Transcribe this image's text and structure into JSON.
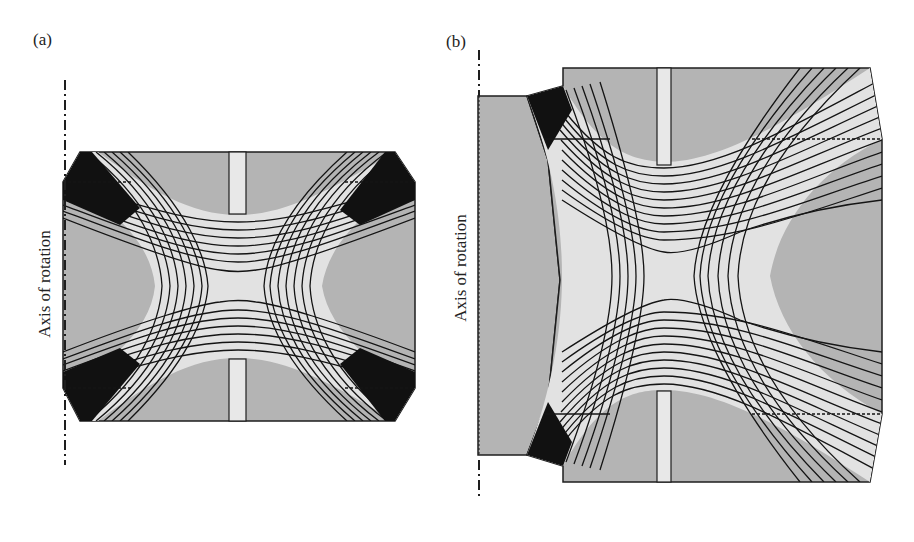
{
  "figure": {
    "panels": [
      {
        "id": "a",
        "label": "(a)",
        "axis_label": "Axis of rotation",
        "description": "Cylindrical ion trap electrode geometry with hyperbolic-like equipotential contours; ring electrode with slit, two chamfered end-cap corners"
      },
      {
        "id": "b",
        "label": "(b)",
        "axis_label": "Axis of rotation",
        "description": "Modified trap geometry with stepped left electrode block and extended right side; equipotential contours in X-shaped saddle pattern"
      }
    ],
    "colors": {
      "electrode_fill": "#b4b4b4",
      "field_region_fill": "#e2e2e2",
      "slit_fill": "#e8e8e8",
      "contour_line": "#141414",
      "outline": "#1e1e1e"
    }
  }
}
